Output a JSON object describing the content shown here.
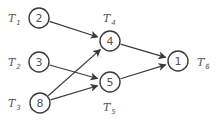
{
  "diagram": {
    "type": "task-dependency-graph",
    "nodes": [
      {
        "id": "T1",
        "label_main": "T",
        "label_sub": "1",
        "weight": "2",
        "cx": 39,
        "cy": 18,
        "lx": 8,
        "ly": 22
      },
      {
        "id": "T2",
        "label_main": "T",
        "label_sub": "2",
        "weight": "3",
        "cx": 39,
        "cy": 62,
        "lx": 8,
        "ly": 66
      },
      {
        "id": "T3",
        "label_main": "T",
        "label_sub": "3",
        "weight": "8",
        "cx": 40,
        "cy": 103,
        "lx": 8,
        "ly": 107
      },
      {
        "id": "T4",
        "label_main": "T",
        "label_sub": "4",
        "weight": "4",
        "cx": 110,
        "cy": 41,
        "lx": 103,
        "ly": 22
      },
      {
        "id": "T5",
        "label_main": "T",
        "label_sub": "5",
        "weight": "5",
        "cx": 110,
        "cy": 82,
        "lx": 103,
        "ly": 111
      },
      {
        "id": "T6",
        "label_main": "T",
        "label_sub": "6",
        "weight": "1",
        "cx": 178,
        "cy": 61,
        "lx": 197,
        "ly": 66
      }
    ],
    "edges": [
      {
        "from": "T1",
        "to": "T4"
      },
      {
        "from": "T2",
        "to": "T5"
      },
      {
        "from": "T3",
        "to": "T4"
      },
      {
        "from": "T3",
        "to": "T5"
      },
      {
        "from": "T4",
        "to": "T6"
      },
      {
        "from": "T5",
        "to": "T6"
      }
    ],
    "node_radius": 10,
    "stroke_color": "#3a3a3a",
    "text_color": "#555555"
  }
}
